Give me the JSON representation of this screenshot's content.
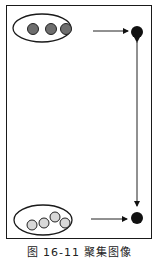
{
  "diagram": {
    "top_group": {
      "label": "",
      "circles": 3,
      "fill": "#6e6e6e"
    },
    "bottom_group": {
      "label": "",
      "circles": 4,
      "fill": "#d8d8d8"
    },
    "node_color": "#111111",
    "connector": "double-headed vertical arrow"
  },
  "caption": "图 16-11 聚集图像"
}
